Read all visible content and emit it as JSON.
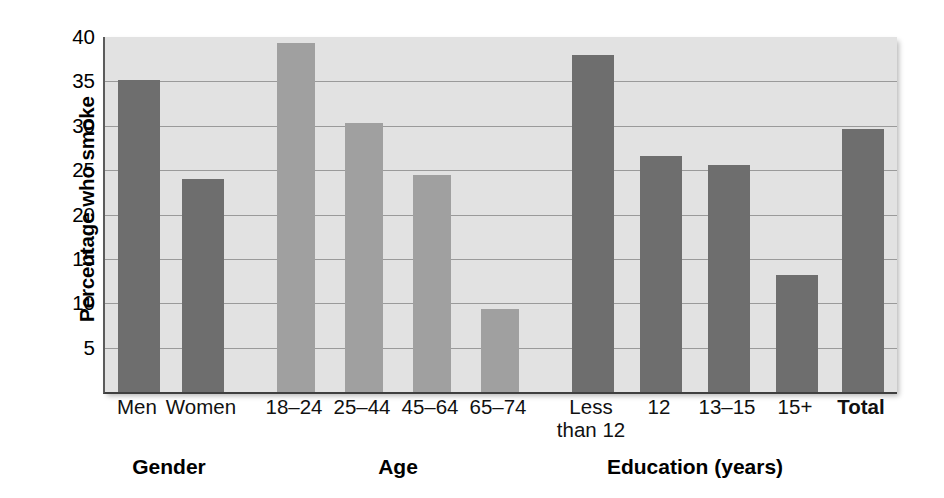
{
  "chart_data": {
    "type": "bar",
    "title": "",
    "xlabel": "",
    "ylabel": "Percentage who smoke",
    "ylim": [
      0,
      40
    ],
    "yticks": [
      5,
      10,
      15,
      20,
      25,
      30,
      35,
      40
    ],
    "ytick_labels": [
      "5",
      "10",
      "15",
      "20",
      "25",
      "30",
      "35",
      "40"
    ],
    "grid": true,
    "legend": "none",
    "categories": [
      "Men",
      "Women",
      "18–24",
      "25–44",
      "45–64",
      "65–74",
      "Less\nthan 12",
      "12",
      "13–15",
      "15+",
      "Total"
    ],
    "values": [
      35.2,
      24.0,
      39.3,
      30.3,
      24.5,
      9.3,
      38.0,
      26.6,
      25.6,
      13.2,
      29.6
    ],
    "groups": [
      {
        "label": "Gender",
        "categories": [
          "Men",
          "Women"
        ],
        "shade": "dark"
      },
      {
        "label": "Age",
        "categories": [
          "18–24",
          "25–44",
          "45–64",
          "65–74"
        ],
        "shade": "light"
      },
      {
        "label": "Education (years)",
        "categories": [
          "Less\nthan 12",
          "12",
          "13–15",
          "15+"
        ],
        "shade": "dark"
      },
      {
        "label": "",
        "categories": [
          "Total"
        ],
        "shade": "dark"
      }
    ]
  },
  "axis": {
    "y_title": "Percentage who smoke",
    "y_ticks": [
      {
        "value": 40,
        "label": "40"
      },
      {
        "value": 35,
        "label": "35"
      },
      {
        "value": 30,
        "label": "30"
      },
      {
        "value": 25,
        "label": "25"
      },
      {
        "value": 20,
        "label": "20"
      },
      {
        "value": 15,
        "label": "15"
      },
      {
        "value": 10,
        "label": "10"
      },
      {
        "value": 5,
        "label": "5"
      }
    ]
  },
  "bars": [
    {
      "label": "Men",
      "value": 35.2,
      "shade": "dark",
      "x": 13,
      "w": 42,
      "bold": false
    },
    {
      "label": "Women",
      "value": 24.0,
      "shade": "dark",
      "x": 77,
      "w": 42,
      "bold": false
    },
    {
      "label": "18–24",
      "value": 39.3,
      "shade": "light",
      "x": 172,
      "w": 38,
      "bold": false
    },
    {
      "label": "25–44",
      "value": 30.3,
      "shade": "light",
      "x": 240,
      "w": 38,
      "bold": false
    },
    {
      "label": "45–64",
      "value": 24.5,
      "shade": "light",
      "x": 308,
      "w": 38,
      "bold": false
    },
    {
      "label": "65–74",
      "value": 9.3,
      "shade": "light",
      "x": 376,
      "w": 38,
      "bold": false
    },
    {
      "label": "Less\nthan 12",
      "value": 38.0,
      "shade": "dark",
      "x": 467,
      "w": 42,
      "bold": false
    },
    {
      "label": "12",
      "value": 26.6,
      "shade": "dark",
      "x": 535,
      "w": 42,
      "bold": false
    },
    {
      "label": "13–15",
      "value": 25.6,
      "shade": "dark",
      "x": 603,
      "w": 42,
      "bold": false
    },
    {
      "label": "15+",
      "value": 13.2,
      "shade": "dark",
      "x": 671,
      "w": 42,
      "bold": false
    },
    {
      "label": "Total",
      "value": 29.6,
      "shade": "dark",
      "x": 737,
      "w": 42,
      "bold": true
    }
  ],
  "group_labels": [
    {
      "text": "Gender",
      "center": 66
    },
    {
      "text": "Age",
      "center": 295
    },
    {
      "text": "Education (years)",
      "center": 592
    }
  ],
  "colors": {
    "bar_dark": "#6e6e6e",
    "bar_light": "#a0a0a0",
    "plot_background": "#e2e2e2",
    "gridline": "#9a9a9a",
    "axis": "#4a4a4a",
    "text": "#000000"
  }
}
